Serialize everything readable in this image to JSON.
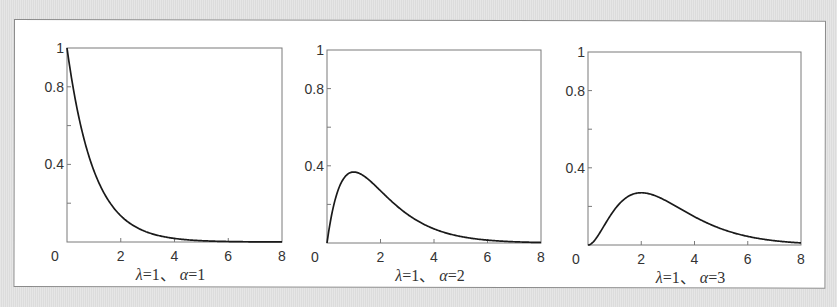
{
  "chart_data": [
    {
      "type": "line",
      "title": "λ=1、α=1",
      "caption": {
        "lambda_sym": "λ",
        "lambda_val": "=1、",
        "alpha_sym": "α",
        "alpha_val": "=1"
      },
      "lambda": 1,
      "alpha": 1,
      "xlabel": "",
      "ylabel": "",
      "xlim": [
        0,
        8
      ],
      "ylim": [
        0,
        1
      ],
      "xticks": [
        0,
        2,
        4,
        6,
        8
      ],
      "yticks": [
        0,
        0.2,
        0.4,
        0.6,
        0.8,
        1
      ],
      "ytick_labels": [
        "0",
        "",
        "0.4",
        "",
        "0.8",
        "1"
      ],
      "grid": false,
      "series": [
        {
          "name": "Gamma pdf (λ=1, α=1)",
          "x": [
            0,
            0.5,
            1,
            1.5,
            2,
            3,
            4,
            5,
            6,
            7,
            8
          ],
          "y": [
            1.0,
            0.607,
            0.368,
            0.223,
            0.135,
            0.05,
            0.018,
            0.007,
            0.002,
            0.001,
            0.0
          ]
        }
      ]
    },
    {
      "type": "line",
      "title": "λ=1、α=2",
      "caption": {
        "lambda_sym": "λ",
        "lambda_val": "=1、",
        "alpha_sym": "α",
        "alpha_val": "=2"
      },
      "lambda": 1,
      "alpha": 2,
      "xlabel": "",
      "ylabel": "",
      "xlim": [
        0,
        8
      ],
      "ylim": [
        0,
        1
      ],
      "xticks": [
        0,
        2,
        4,
        6,
        8
      ],
      "yticks": [
        0,
        0.2,
        0.4,
        0.6,
        0.8,
        1
      ],
      "ytick_labels": [
        "0",
        "",
        "0.4",
        "",
        "0.8",
        "1"
      ],
      "grid": false,
      "series": [
        {
          "name": "Gamma pdf (λ=1, α=2)",
          "x": [
            0,
            0.5,
            1,
            1.5,
            2,
            3,
            4,
            5,
            6,
            7,
            8
          ],
          "y": [
            0.0,
            0.303,
            0.368,
            0.335,
            0.271,
            0.149,
            0.073,
            0.034,
            0.015,
            0.006,
            0.003
          ]
        }
      ]
    },
    {
      "type": "line",
      "title": "λ=1、α=3",
      "caption": {
        "lambda_sym": "λ",
        "lambda_val": "=1、",
        "alpha_sym": "α",
        "alpha_val": "=3"
      },
      "lambda": 1,
      "alpha": 3,
      "xlabel": "",
      "ylabel": "",
      "xlim": [
        0,
        8
      ],
      "ylim": [
        0,
        1
      ],
      "xticks": [
        0,
        2,
        4,
        6,
        8
      ],
      "yticks": [
        0,
        0.2,
        0.4,
        0.6,
        0.8,
        1
      ],
      "ytick_labels": [
        "0",
        "",
        "0.4",
        "",
        "0.8",
        "1"
      ],
      "grid": false,
      "series": [
        {
          "name": "Gamma pdf (λ=1, α=3)",
          "x": [
            0,
            0.5,
            1,
            1.5,
            2,
            3,
            4,
            5,
            6,
            7,
            8
          ],
          "y": [
            0.0,
            0.076,
            0.184,
            0.251,
            0.271,
            0.224,
            0.147,
            0.084,
            0.045,
            0.022,
            0.011
          ]
        }
      ]
    }
  ],
  "layout": {
    "frames": [
      {
        "left": 67,
        "top": 48,
        "right": 282,
        "bottom": 242
      },
      {
        "left": 327,
        "top": 50,
        "right": 541,
        "bottom": 243
      },
      {
        "left": 588,
        "top": 52,
        "right": 801,
        "bottom": 245
      }
    ]
  }
}
